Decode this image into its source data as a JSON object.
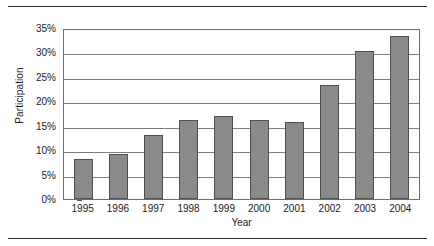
{
  "figure": {
    "background_color": "#ffffff",
    "rule_color": "#2b2b2b",
    "top_rule_name": "top-rule",
    "bottom_rule_name": "bottom-rule"
  },
  "chart_data": {
    "type": "bar",
    "title": "",
    "subtitle": "",
    "xlabel": "Year",
    "ylabel": "Participation",
    "categories": [
      "1995",
      "1996",
      "1997",
      "1998",
      "1999",
      "2000",
      "2001",
      "2002",
      "2003",
      "2004"
    ],
    "values": [
      8.2,
      9.2,
      13.1,
      16.2,
      17.0,
      16.2,
      15.8,
      23.3,
      30.3,
      33.3
    ],
    "value_labels": [
      "8.2%",
      "9.2%",
      "13.1%",
      "16.2%",
      "17.0%",
      "16.2%",
      "15.8%",
      "23.3%",
      "30.3%",
      "33.3%"
    ],
    "ylim": [
      0,
      35
    ],
    "ytick_values": [
      0,
      5,
      10,
      15,
      20,
      25,
      30,
      35
    ],
    "ytick_labels": [
      "0%",
      "5%",
      "10%",
      "15%",
      "20%",
      "25%",
      "30%",
      "35%"
    ],
    "xtick_labels": [
      "1995",
      "1996",
      "1997",
      "1998",
      "1999",
      "2000",
      "2001",
      "2002",
      "2003",
      "2004"
    ],
    "grid": true,
    "grid_axis": "y",
    "legend": false,
    "legend_position": "none",
    "bar_color": "#8a8a8a",
    "bar_edge_color": "#4f4f4f",
    "grid_color": "#7d7d7d",
    "axis_color": "#6e6e6e"
  }
}
